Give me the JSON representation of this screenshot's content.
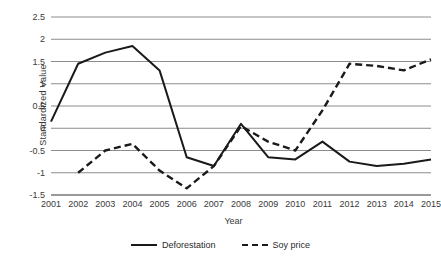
{
  "chart_data": {
    "type": "line",
    "title": "",
    "xlabel": "Year",
    "ylabel": "Standardized Value",
    "categories": [
      "2001",
      "2002",
      "2003",
      "2004",
      "2005",
      "2006",
      "2007",
      "2008",
      "2009",
      "2010",
      "2011",
      "2012",
      "2013",
      "2014",
      "2015"
    ],
    "x": [
      2001,
      2002,
      2003,
      2004,
      2005,
      2006,
      2007,
      2008,
      2009,
      2010,
      2011,
      2012,
      2013,
      2014,
      2015
    ],
    "ylim": [
      -1.5,
      2.5
    ],
    "yticks": [
      2.5,
      2,
      1.5,
      1,
      0.5,
      0,
      -0.5,
      -1,
      -1.5
    ],
    "ytick_labels": [
      "2.5",
      "2",
      "1.5",
      "1",
      "0.5",
      "0",
      "-0.5",
      "-1",
      "-1.5"
    ],
    "grid": true,
    "grid_axis": "y",
    "legend_position": "bottom",
    "series": [
      {
        "name": "Deforestation",
        "style": "solid",
        "color": "#1a1a1a",
        "values": [
          0.15,
          1.45,
          1.7,
          1.85,
          1.3,
          -0.65,
          -0.85,
          0.1,
          -0.65,
          -0.7,
          -0.3,
          -0.75,
          -0.85,
          -0.8,
          -0.7
        ]
      },
      {
        "name": "Soy price",
        "style": "dashed",
        "color": "#1a1a1a",
        "values": [
          null,
          -1.0,
          -0.5,
          -0.35,
          -0.95,
          -1.35,
          -0.85,
          0.05,
          -0.3,
          -0.5,
          0.4,
          1.45,
          1.4,
          1.3,
          1.55
        ]
      }
    ]
  },
  "legend": {
    "items": [
      {
        "label": "Deforestation",
        "style": "solid"
      },
      {
        "label": "Soy price",
        "style": "dashed"
      }
    ]
  },
  "axis_titles": {
    "x": "Year",
    "y": "Standardized Value"
  }
}
